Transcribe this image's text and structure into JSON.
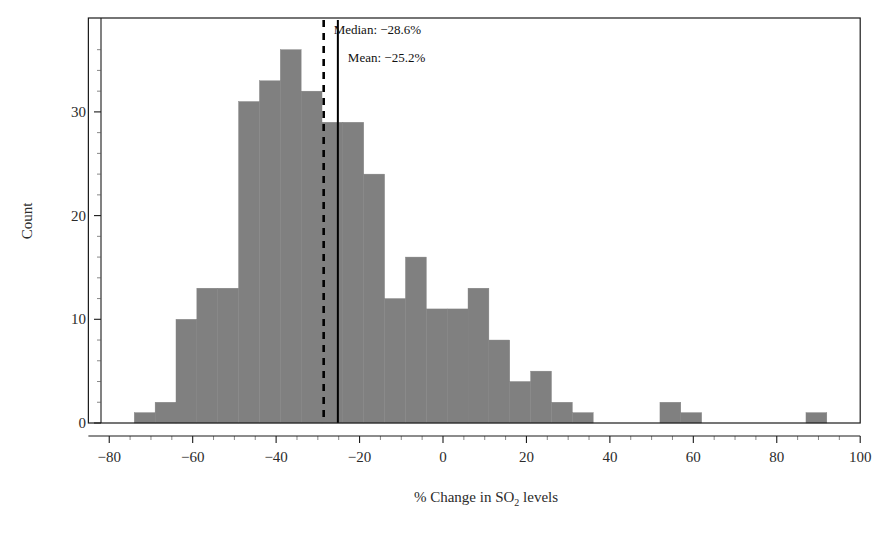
{
  "chart_data": {
    "type": "bar",
    "subtype": "histogram",
    "title": "",
    "xlabel": "% Change in SO2 levels",
    "xlabel_parts": {
      "pre": "% Change in SO",
      "sub": "2",
      "post": " levels"
    },
    "ylabel": "Count",
    "xlim": [
      -85,
      100
    ],
    "ylim": [
      0,
      38
    ],
    "xticks": [
      -80,
      -60,
      -40,
      -20,
      0,
      20,
      40,
      60,
      80,
      100
    ],
    "xtick_labels": [
      "−80",
      "−60",
      "−40",
      "−20",
      "0",
      "20",
      "40",
      "60",
      "80",
      "100"
    ],
    "yticks": [
      0,
      10,
      20,
      30
    ],
    "ytick_labels": [
      "0",
      "10",
      "20",
      "30"
    ],
    "grid": false,
    "legend": "none",
    "bin_width": 5,
    "bar_color": "#808080",
    "bar_edge_color": "#808080",
    "axis_color": "#1a1a1a",
    "bins": [
      {
        "x0": -74,
        "x1": -69,
        "count": 1
      },
      {
        "x0": -69,
        "x1": -64,
        "count": 2
      },
      {
        "x0": -64,
        "x1": -59,
        "count": 10
      },
      {
        "x0": -59,
        "x1": -54,
        "count": 13
      },
      {
        "x0": -54,
        "x1": -49,
        "count": 13
      },
      {
        "x0": -49,
        "x1": -44,
        "count": 31
      },
      {
        "x0": -44,
        "x1": -39,
        "count": 33
      },
      {
        "x0": -39,
        "x1": -34,
        "count": 36
      },
      {
        "x0": -34,
        "x1": -29,
        "count": 32
      },
      {
        "x0": -29,
        "x1": -24,
        "count": 29
      },
      {
        "x0": -24,
        "x1": -19,
        "count": 29
      },
      {
        "x0": -19,
        "x1": -14,
        "count": 24
      },
      {
        "x0": -14,
        "x1": -9,
        "count": 12
      },
      {
        "x0": -9,
        "x1": -4,
        "count": 16
      },
      {
        "x0": -4,
        "x1": 1,
        "count": 11
      },
      {
        "x0": 1,
        "x1": 6,
        "count": 11
      },
      {
        "x0": 6,
        "x1": 11,
        "count": 13
      },
      {
        "x0": 11,
        "x1": 16,
        "count": 8
      },
      {
        "x0": 16,
        "x1": 21,
        "count": 4
      },
      {
        "x0": 21,
        "x1": 26,
        "count": 5
      },
      {
        "x0": 26,
        "x1": 31,
        "count": 2
      },
      {
        "x0": 31,
        "x1": 36,
        "count": 1
      },
      {
        "x0": 52,
        "x1": 57,
        "count": 2
      },
      {
        "x0": 57,
        "x1": 62,
        "count": 1
      },
      {
        "x0": 87,
        "x1": 92,
        "count": 1
      }
    ],
    "reference_lines": [
      {
        "name": "median",
        "label": "Median: −28.6%",
        "value": -28.6,
        "style": "dashed",
        "color": "#000000"
      },
      {
        "name": "mean",
        "label": "Mean: −25.2%",
        "value": -25.2,
        "style": "solid",
        "color": "#000000"
      }
    ]
  }
}
